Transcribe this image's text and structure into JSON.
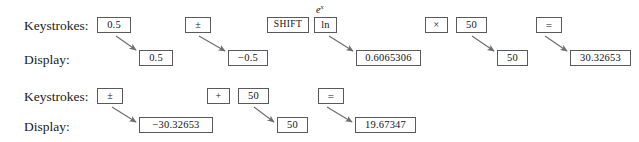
{
  "figure": {
    "kind": "calculator-keystroke-sequence",
    "background_color": "#ffffff",
    "box_border_color": "#5a5a5a",
    "arrow_color": "#6e6e6e",
    "text_color": "#141414"
  },
  "rows": [
    {
      "id": "sequence-1",
      "keystrokes_label": "Keystrokes:",
      "display_label": "Display:",
      "keys": [
        {
          "id": "k1-1",
          "text": "0.5",
          "superscript": null,
          "x": 97,
          "y": 17,
          "w": 34,
          "h": 16,
          "style": "serif-num"
        },
        {
          "id": "k1-2",
          "text": "±",
          "superscript": null,
          "x": 185,
          "y": 17,
          "w": 26,
          "h": 16,
          "style": "sym"
        },
        {
          "id": "k1-3",
          "text": "SHIFT",
          "superscript": null,
          "x": 267,
          "y": 17,
          "w": 42,
          "h": 16,
          "style": "shift-label"
        },
        {
          "id": "k1-4",
          "text": "ln",
          "superscript": "e^x",
          "x": 314,
          "y": 17,
          "w": 23,
          "h": 16,
          "style": "serif-num"
        },
        {
          "id": "k1-5",
          "text": "×",
          "superscript": null,
          "x": 425,
          "y": 17,
          "w": 23,
          "h": 16,
          "style": "sym"
        },
        {
          "id": "k1-6",
          "text": "50",
          "superscript": null,
          "x": 456,
          "y": 17,
          "w": 31,
          "h": 16,
          "style": "serif-num"
        },
        {
          "id": "k1-7",
          "text": "=",
          "superscript": null,
          "x": 536,
          "y": 17,
          "w": 26,
          "h": 16,
          "style": "eq"
        }
      ],
      "displays": [
        {
          "id": "d1-1",
          "text": "0.5",
          "x": 139,
          "y": 50,
          "w": 34,
          "h": 16,
          "from": "k1-1"
        },
        {
          "id": "d1-2",
          "text": "−0.5",
          "x": 228,
          "y": 50,
          "w": 40,
          "h": 16,
          "from": "k1-2"
        },
        {
          "id": "d1-3",
          "text": "0.6065306",
          "x": 356,
          "y": 50,
          "w": 65,
          "h": 16,
          "from": "k1-4"
        },
        {
          "id": "d1-4",
          "text": "50",
          "x": 497,
          "y": 50,
          "w": 31,
          "h": 16,
          "from": "k1-6"
        },
        {
          "id": "d1-5",
          "text": "30.32653",
          "x": 570,
          "y": 50,
          "w": 61,
          "h": 16,
          "from": "k1-7"
        }
      ],
      "arrows": [
        {
          "id": "a1-1",
          "x1": 116,
          "y1": 36,
          "x2": 136,
          "y2": 50
        },
        {
          "id": "a1-2",
          "x1": 199,
          "y1": 36,
          "x2": 225,
          "y2": 51
        },
        {
          "id": "a1-3",
          "x1": 329,
          "y1": 36,
          "x2": 353,
          "y2": 51
        },
        {
          "id": "a1-4",
          "x1": 472,
          "y1": 36,
          "x2": 494,
          "y2": 51
        },
        {
          "id": "a1-5",
          "x1": 545,
          "y1": 36,
          "x2": 567,
          "y2": 51
        }
      ]
    },
    {
      "id": "sequence-2",
      "keystrokes_label": "Keystrokes:",
      "display_label": "Display:",
      "keys": [
        {
          "id": "k2-1",
          "text": "±",
          "superscript": null,
          "x": 97,
          "y": 88,
          "w": 26,
          "h": 16,
          "style": "sym"
        },
        {
          "id": "k2-2",
          "text": "+",
          "superscript": null,
          "x": 207,
          "y": 88,
          "w": 23,
          "h": 16,
          "style": "sym"
        },
        {
          "id": "k2-3",
          "text": "50",
          "superscript": null,
          "x": 238,
          "y": 88,
          "w": 31,
          "h": 16,
          "style": "serif-num"
        },
        {
          "id": "k2-4",
          "text": "=",
          "superscript": null,
          "x": 318,
          "y": 88,
          "w": 26,
          "h": 16,
          "style": "eq"
        }
      ],
      "displays": [
        {
          "id": "d2-1",
          "text": "−30.32653",
          "x": 139,
          "y": 117,
          "w": 74,
          "h": 16,
          "from": "k2-1"
        },
        {
          "id": "d2-2",
          "text": "50",
          "x": 277,
          "y": 117,
          "w": 31,
          "h": 16,
          "from": "k2-3"
        },
        {
          "id": "d2-3",
          "text": "19.67347",
          "x": 355,
          "y": 117,
          "w": 61,
          "h": 16,
          "from": "k2-4"
        }
      ],
      "arrows": [
        {
          "id": "a2-1",
          "x1": 112,
          "y1": 107,
          "x2": 136,
          "y2": 122
        },
        {
          "id": "a2-2",
          "x1": 254,
          "y1": 107,
          "x2": 274,
          "y2": 122
        },
        {
          "id": "a2-3",
          "x1": 327,
          "y1": 107,
          "x2": 352,
          "y2": 122
        }
      ]
    }
  ],
  "label_positions": {
    "row1_keystrokes": {
      "x": 24,
      "y": 19
    },
    "row1_display": {
      "x": 24,
      "y": 53
    },
    "row2_keystrokes": {
      "x": 24,
      "y": 90
    },
    "row2_display": {
      "x": 24,
      "y": 120
    }
  }
}
